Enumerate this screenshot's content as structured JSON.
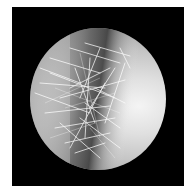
{
  "image": {
    "description": "Grayscale circular microscope field showing a dense cluster of thin, bright, needle-like crystals along a darker diagonal band, on a black square background with a white border",
    "colors": {
      "border": "#ffffff",
      "background": "#000000",
      "field_light": "#f0f0f0",
      "field_dark": "#4a4a4a",
      "crystal": "#ffffff"
    }
  }
}
